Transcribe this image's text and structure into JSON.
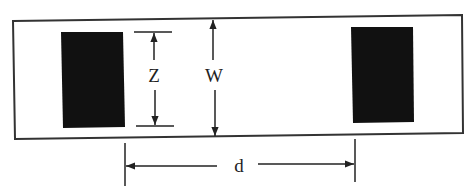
{
  "diagram": {
    "type": "dimensioned-layout",
    "colors": {
      "background": "#ffffff",
      "line": "#333333",
      "block_fill": "#111111"
    },
    "outer_strip": {
      "label": ""
    },
    "blocks": [
      {
        "id": "left-block",
        "label": ""
      },
      {
        "id": "right-block",
        "label": ""
      }
    ],
    "dimensions": {
      "z": {
        "label": "Z",
        "meaning": "height of block"
      },
      "w": {
        "label": "W",
        "meaning": "width of strip"
      },
      "d": {
        "label": "d",
        "meaning": "spacing between blocks"
      }
    }
  }
}
